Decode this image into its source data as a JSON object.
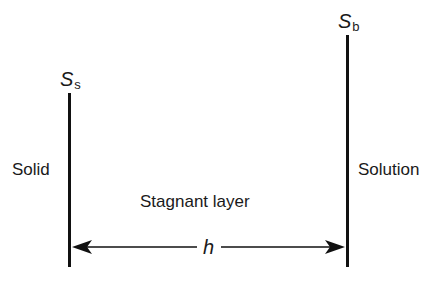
{
  "diagram": {
    "left_boundary": {
      "region_label": "Solid",
      "symbol": "S",
      "subscript": "s"
    },
    "right_boundary": {
      "region_label": "Solution",
      "symbol": "S",
      "subscript": "b"
    },
    "middle": {
      "layer_label": "Stagnant layer",
      "thickness_symbol": "h"
    },
    "colors": {
      "line": "#111111",
      "text": "#1a1a1a",
      "background": "#ffffff"
    }
  }
}
